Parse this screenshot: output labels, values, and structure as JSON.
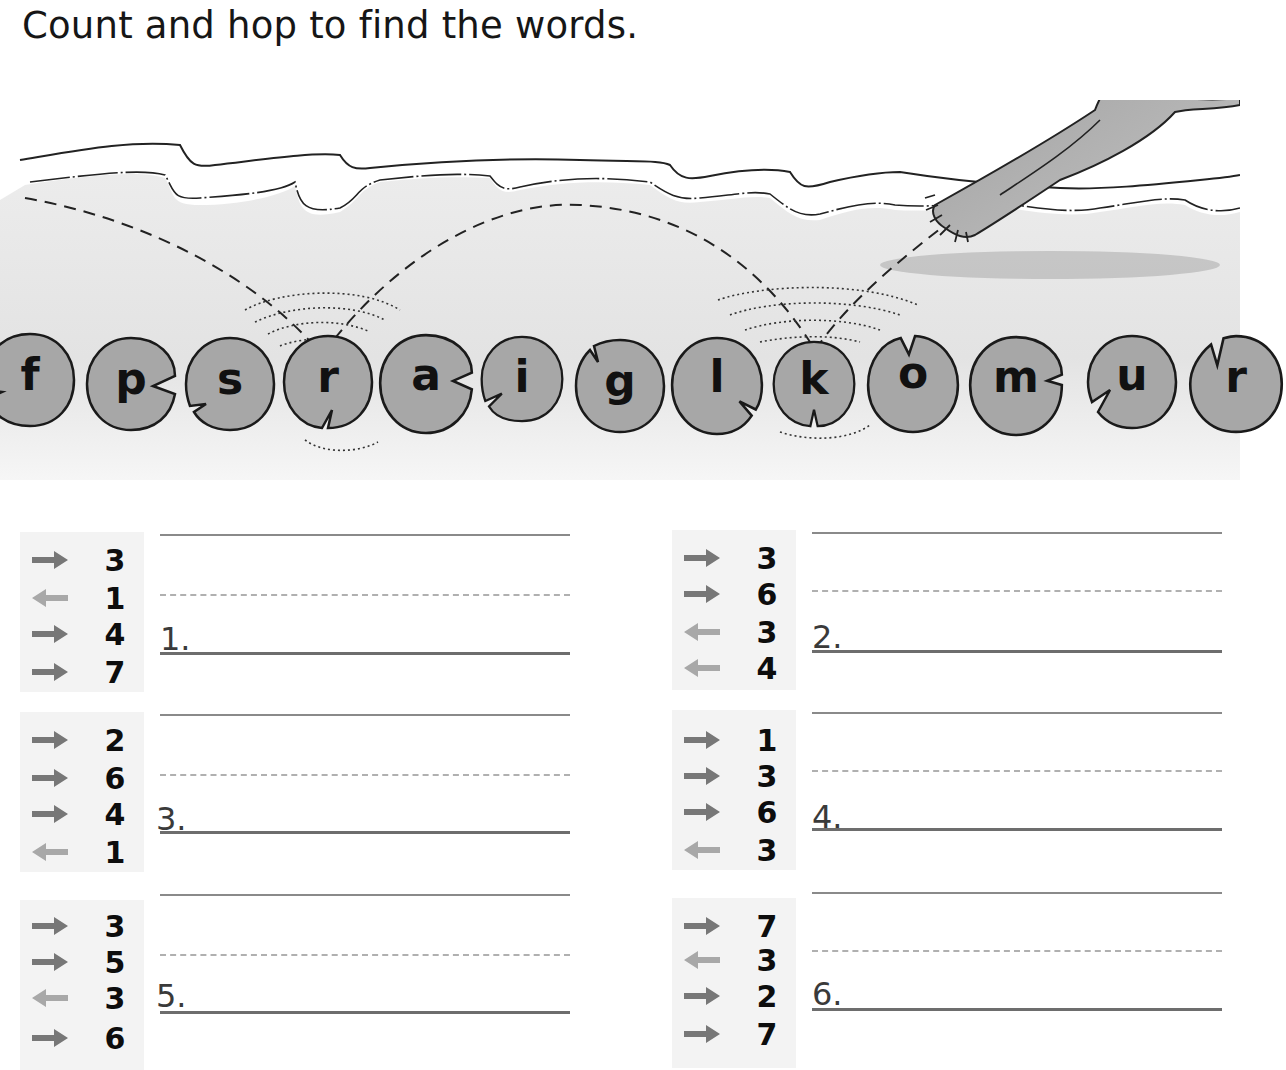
{
  "title": "Count and hop to find the words.",
  "illustration": {
    "description": "frog hopping across lily pads on a pond",
    "frog_icon": "frog-icon",
    "pond_color": "#e6e6e6",
    "pad_color": "#a9a9a9",
    "pad_outline": "#1a1a1a"
  },
  "lily_pads": [
    {
      "letter": "f"
    },
    {
      "letter": "p"
    },
    {
      "letter": "s"
    },
    {
      "letter": "r"
    },
    {
      "letter": "a"
    },
    {
      "letter": "i"
    },
    {
      "letter": "g"
    },
    {
      "letter": "l"
    },
    {
      "letter": "k"
    },
    {
      "letter": "o"
    },
    {
      "letter": "m"
    },
    {
      "letter": "u"
    },
    {
      "letter": "r"
    }
  ],
  "legend": {
    "forward_arrow": {
      "icon": "arrow-right-icon",
      "color": "#777777"
    },
    "back_arrow": {
      "icon": "arrow-left-icon",
      "color": "#a8a8a8"
    }
  },
  "exercises": [
    {
      "number": "1.",
      "clues": [
        {
          "direction": "right",
          "count": "3"
        },
        {
          "direction": "left",
          "count": "1"
        },
        {
          "direction": "right",
          "count": "4"
        },
        {
          "direction": "right",
          "count": "7"
        }
      ],
      "answer": ""
    },
    {
      "number": "2.",
      "clues": [
        {
          "direction": "right",
          "count": "3"
        },
        {
          "direction": "right",
          "count": "6"
        },
        {
          "direction": "left",
          "count": "3"
        },
        {
          "direction": "left",
          "count": "4"
        }
      ],
      "answer": ""
    },
    {
      "number": "3.",
      "clues": [
        {
          "direction": "right",
          "count": "2"
        },
        {
          "direction": "right",
          "count": "6"
        },
        {
          "direction": "right",
          "count": "4"
        },
        {
          "direction": "left",
          "count": "1"
        }
      ],
      "answer": ""
    },
    {
      "number": "4.",
      "clues": [
        {
          "direction": "right",
          "count": "1"
        },
        {
          "direction": "right",
          "count": "3"
        },
        {
          "direction": "right",
          "count": "6"
        },
        {
          "direction": "left",
          "count": "3"
        }
      ],
      "answer": ""
    },
    {
      "number": "5.",
      "clues": [
        {
          "direction": "right",
          "count": "3"
        },
        {
          "direction": "right",
          "count": "5"
        },
        {
          "direction": "left",
          "count": "3"
        },
        {
          "direction": "right",
          "count": "6"
        }
      ],
      "answer": ""
    },
    {
      "number": "6.",
      "clues": [
        {
          "direction": "right",
          "count": "7"
        },
        {
          "direction": "left",
          "count": "3"
        },
        {
          "direction": "right",
          "count": "2"
        },
        {
          "direction": "right",
          "count": "7"
        }
      ],
      "answer": ""
    }
  ]
}
